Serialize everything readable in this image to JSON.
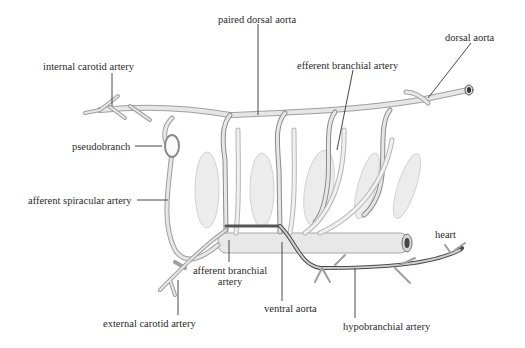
{
  "diagram": {
    "colors": {
      "vessel_fill": "#e6e6e6",
      "vessel_edge": "#9a9a9a",
      "vessel_dark": "#5a5a5a",
      "gill_fill": "#ececec",
      "leader_line": "#333333",
      "label_text": "#2a2a2a"
    },
    "labels": {
      "paired_dorsal_aorta": "paired dorsal aorta",
      "dorsal_aorta": "dorsal aorta",
      "internal_carotid_artery": "internal carotid artery",
      "efferent_branchial_artery": "efferent branchial artery",
      "pseudobranch": "pseudobranch",
      "afferent_spiracular_artery": "afferent spiracular artery",
      "heart": "heart",
      "afferent_branchial_artery_line1": "afferent branchial",
      "afferent_branchial_artery_line2": "artery",
      "ventral_aorta": "ventral aorta",
      "external_carotid_artery": "external carotid artery",
      "hypobranchial_artery": "hypobranchial artery"
    }
  }
}
